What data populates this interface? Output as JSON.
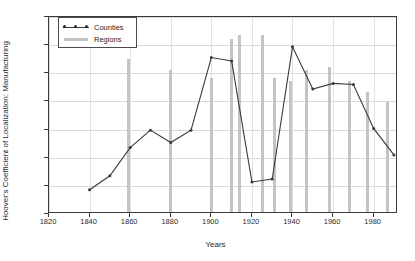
{
  "chart_data": {
    "type": "line",
    "title": "",
    "xlabel": "Years",
    "ylabel": "Hoover's Coefficient of Localization: Manufacturing",
    "xlim": [
      1820,
      1992
    ],
    "ylim": [
      0,
      0.35
    ],
    "yticks": [
      "0",
      "0.05",
      "0.1",
      "0.15",
      "0.2",
      "0.25",
      "0.3",
      "0.35"
    ],
    "ytick_values": [
      0,
      0.05,
      0.1,
      0.15,
      0.2,
      0.25,
      0.3,
      0.35
    ],
    "xticks": [
      "1820",
      "1840",
      "1860",
      "1880",
      "1900",
      "1920",
      "1940",
      "1960",
      "1980"
    ],
    "xtick_values": [
      1820,
      1840,
      1860,
      1880,
      1900,
      1920,
      1940,
      1960,
      1980
    ],
    "grid": true,
    "legend_position": "upper-left",
    "legend": [
      "Counties",
      "Regions"
    ],
    "series": [
      {
        "name": "Counties",
        "type": "line",
        "color": "#3a3a3a",
        "marker": "dot",
        "points": [
          {
            "x": 1840,
            "y": 0.043
          },
          {
            "x": 1850,
            "y": 0.068
          },
          {
            "x": 1860,
            "y": 0.118
          },
          {
            "x": 1870,
            "y": 0.149
          },
          {
            "x": 1880,
            "y": 0.127
          },
          {
            "x": 1890,
            "y": 0.149
          },
          {
            "x": 1900,
            "y": 0.278
          },
          {
            "x": 1910,
            "y": 0.272
          },
          {
            "x": 1920,
            "y": 0.057
          },
          {
            "x": 1930,
            "y": 0.062
          },
          {
            "x": 1940,
            "y": 0.297
          },
          {
            "x": 1950,
            "y": 0.222
          },
          {
            "x": 1960,
            "y": 0.232
          },
          {
            "x": 1970,
            "y": 0.23
          },
          {
            "x": 1980,
            "y": 0.152
          },
          {
            "x": 1990,
            "y": 0.105
          }
        ]
      },
      {
        "name": "Regions",
        "type": "bar",
        "color": "#c4c4c4",
        "points": [
          {
            "x": 1859,
            "y": 0.272
          },
          {
            "x": 1880,
            "y": 0.253
          },
          {
            "x": 1900,
            "y": 0.238
          },
          {
            "x": 1910,
            "y": 0.307
          },
          {
            "x": 1914,
            "y": 0.315
          },
          {
            "x": 1925,
            "y": 0.315
          },
          {
            "x": 1931,
            "y": 0.238
          },
          {
            "x": 1939,
            "y": 0.232
          },
          {
            "x": 1947,
            "y": 0.253
          },
          {
            "x": 1958,
            "y": 0.258
          },
          {
            "x": 1968,
            "y": 0.232
          },
          {
            "x": 1977,
            "y": 0.214
          },
          {
            "x": 1987,
            "y": 0.195
          }
        ]
      }
    ]
  }
}
